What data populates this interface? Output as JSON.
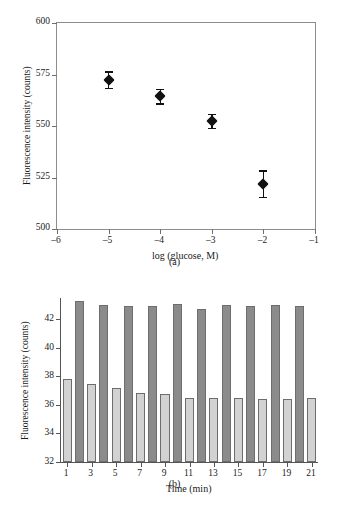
{
  "figure": {
    "panel_a_caption": "(a)",
    "panel_b_caption": "(b)"
  },
  "chart_data": [
    {
      "type": "scatter",
      "panel": "(a)",
      "title": "",
      "xlabel": "log (glucose, M)",
      "ylabel": "Fluorescence intensity (counts)",
      "xlim": [
        -6,
        -1
      ],
      "ylim": [
        500,
        600
      ],
      "xticks": [
        -6,
        -5,
        -4,
        -3,
        -2,
        -1
      ],
      "xtick_labels": [
        "–6",
        "–5",
        "–4",
        "–3",
        "–2",
        "–1"
      ],
      "yticks": [
        500,
        525,
        550,
        575,
        600
      ],
      "ytick_labels": [
        "500",
        "525",
        "550",
        "575",
        "600"
      ],
      "grid": false,
      "legend": "none",
      "marker": "filled-diamond",
      "x": [
        -5,
        -4,
        -3,
        -2
      ],
      "y": [
        572.5,
        564.5,
        552.5,
        522
      ],
      "yerr": [
        4,
        3.5,
        3.5,
        6.5
      ]
    },
    {
      "type": "bar",
      "panel": "(b)",
      "title": "",
      "xlabel": "Time (min)",
      "ylabel": "Fluorescence intensity (counts)",
      "ylim": [
        32,
        43.5
      ],
      "yticks": [
        32,
        34,
        36,
        38,
        40,
        42
      ],
      "ytick_labels": [
        "32",
        "34",
        "36",
        "38",
        "40",
        "42"
      ],
      "xticks": [
        1,
        3,
        5,
        7,
        9,
        11,
        13,
        15,
        17,
        19,
        21
      ],
      "xtick_labels": [
        "1",
        "3",
        "5",
        "7",
        "9",
        "11",
        "13",
        "15",
        "17",
        "19",
        "21"
      ],
      "grid": false,
      "legend": "none",
      "series_colors": {
        "light": "#d2d2d2",
        "dark": "#8b8b8b"
      },
      "categories": [
        1,
        2,
        3,
        4,
        5,
        6,
        7,
        8,
        9,
        10,
        11,
        12,
        13,
        14,
        15,
        16,
        17,
        18,
        19,
        20,
        21
      ],
      "values": [
        37.8,
        43.3,
        37.5,
        43.0,
        37.2,
        42.95,
        36.85,
        42.95,
        36.8,
        43.1,
        36.5,
        42.7,
        36.5,
        43.0,
        36.5,
        42.95,
        36.45,
        43.0,
        36.45,
        42.95,
        36.5
      ],
      "bar_shades": [
        "light",
        "dark",
        "light",
        "dark",
        "light",
        "dark",
        "light",
        "dark",
        "light",
        "dark",
        "light",
        "dark",
        "light",
        "dark",
        "light",
        "dark",
        "light",
        "dark",
        "light",
        "dark",
        "light"
      ]
    }
  ]
}
